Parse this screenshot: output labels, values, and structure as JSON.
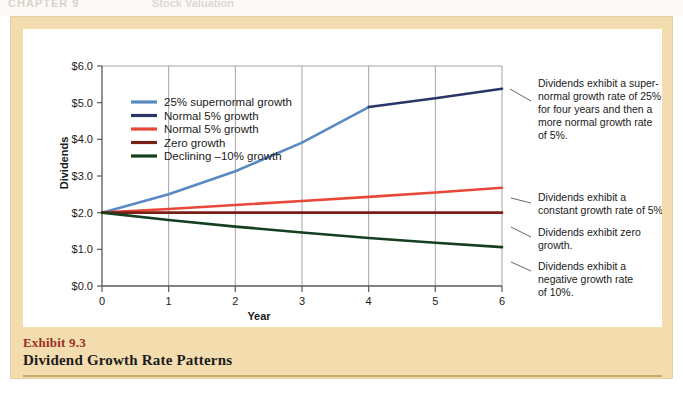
{
  "page_header": {
    "chapter": "CHAPTER 9",
    "section": "Stock Valuation"
  },
  "exhibit": {
    "label": "Exhibit 9.3",
    "title": "Dividend Growth Rate Patterns"
  },
  "colors": {
    "supernormal": "#5a8ac4",
    "normal_navy": "#2a3668",
    "normal_red": "#e8483a",
    "zero_maroon": "#7a1f16",
    "declining_green": "#14401f",
    "frame_tan": "#f3dcae",
    "caption_red": "#9c3024",
    "axis": "#5a5a5a",
    "grid": "#9a9a9a"
  },
  "chart_data": {
    "type": "line",
    "title": "Dividend Growth Rate Patterns",
    "xlabel": "Year",
    "ylabel": "Dividends",
    "xlim": [
      0,
      6
    ],
    "ylim": [
      0,
      6
    ],
    "x": [
      0,
      1,
      2,
      3,
      4,
      5,
      6
    ],
    "xticklabels": [
      "0",
      "1",
      "2",
      "3",
      "4",
      "5",
      "6"
    ],
    "yticklabels": [
      "$0.0",
      "$1.0",
      "$2.0",
      "$3.0",
      "$4.0",
      "$5.0",
      "$6.0"
    ],
    "ytickvalues": [
      0,
      1,
      2,
      3,
      4,
      5,
      6
    ],
    "grid": "vertical",
    "legend_position": "upper-left-inside",
    "series": [
      {
        "name": "25% supernormal growth",
        "color": "#5a8ac4",
        "values": [
          2.0,
          2.5,
          3.13,
          3.91,
          4.88,
          null,
          null
        ]
      },
      {
        "name": "Normal 5% growth",
        "color": "#2a3668",
        "values": [
          null,
          null,
          null,
          null,
          4.88,
          5.12,
          5.38
        ]
      },
      {
        "name": "Normal 5% growth",
        "color": "#e8483a",
        "values": [
          2.0,
          2.1,
          2.21,
          2.32,
          2.43,
          2.55,
          2.68
        ]
      },
      {
        "name": "Zero growth",
        "color": "#7a1f16",
        "values": [
          2.0,
          2.0,
          2.0,
          2.0,
          2.0,
          2.0,
          2.0
        ]
      },
      {
        "name": "Declining –10% growth",
        "color": "#14401f",
        "values": [
          2.0,
          1.8,
          1.62,
          1.46,
          1.31,
          1.18,
          1.06
        ]
      }
    ],
    "annotations": [
      {
        "id": "supernormal-note",
        "lines": [
          "Dividends exhibit a super-",
          "normal growth rate of 25%",
          "for four years and then a",
          "more normal growth rate",
          "of 5%."
        ]
      },
      {
        "id": "constant-note",
        "lines": [
          "Dividends exhibit a",
          "constant growth rate of 5%."
        ]
      },
      {
        "id": "zero-note",
        "lines": [
          "Dividends exhibit zero",
          "growth."
        ]
      },
      {
        "id": "negative-note",
        "lines": [
          "Dividends exhibit a",
          "negative growth rate",
          "of 10%."
        ]
      }
    ]
  }
}
